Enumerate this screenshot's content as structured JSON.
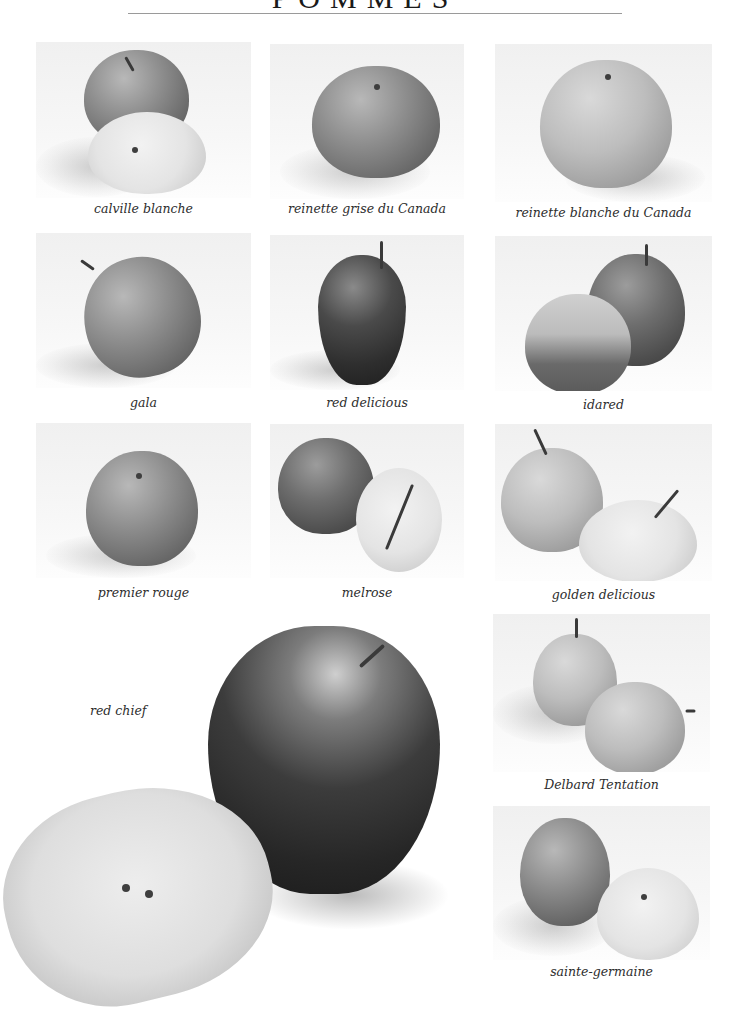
{
  "page": {
    "title": "POMMES"
  },
  "varieties": [
    {
      "id": "calville-blanche",
      "caption": "calville blanche"
    },
    {
      "id": "reinette-grise-du-canada",
      "caption": "reinette grise du Canada"
    },
    {
      "id": "reinette-blanche-du-canada",
      "caption": "reinette blanche du Canada"
    },
    {
      "id": "gala",
      "caption": "gala"
    },
    {
      "id": "red-delicious",
      "caption": "red delicious"
    },
    {
      "id": "idared",
      "caption": "idared"
    },
    {
      "id": "premier-rouge",
      "caption": "premier rouge"
    },
    {
      "id": "melrose",
      "caption": "melrose"
    },
    {
      "id": "golden-delicious",
      "caption": "golden delicious"
    },
    {
      "id": "red-chief",
      "caption": "red chief"
    },
    {
      "id": "delbard-tentation",
      "caption": "Delbard Tentation"
    },
    {
      "id": "sainte-germaine",
      "caption": "sainte-germaine"
    }
  ]
}
